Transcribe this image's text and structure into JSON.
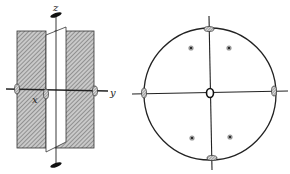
{
  "figure": {
    "left": {
      "title": "symmetry elements of point group mm2 / 222 (perspective)",
      "axis_labels": {
        "z": "z",
        "x": "x",
        "y": "y"
      }
    },
    "right": {
      "title": "stereographic projection",
      "pole_count": 4
    }
  }
}
